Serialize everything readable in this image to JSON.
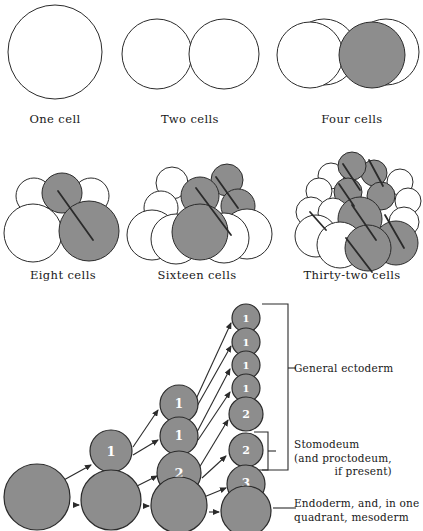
{
  "figure": {
    "colors": {
      "cell_fill_shaded": "#8d8d8d",
      "cell_fill_clear": "#ffffff",
      "outline": "#2b2b2b",
      "text": "#181818",
      "background": "#ffffff"
    },
    "cleavage_stages": [
      {
        "id": "one-cell",
        "label": "One cell",
        "label_x": 55,
        "label_y": 112,
        "cells": [
          {
            "cx": 55,
            "cy": 52,
            "r": 47,
            "shaded": false
          }
        ],
        "axis_lines": []
      },
      {
        "id": "two-cells",
        "label": "Two cells",
        "label_x": 190,
        "label_y": 112,
        "cells": [
          {
            "cx": 157,
            "cy": 54,
            "r": 35,
            "shaded": false
          },
          {
            "cx": 224,
            "cy": 54,
            "r": 35,
            "shaded": false
          }
        ],
        "axis_lines": []
      },
      {
        "id": "four-cells",
        "label": "Four cells",
        "label_x": 352,
        "label_y": 112,
        "cells": [
          {
            "cx": 324,
            "cy": 52,
            "r": 33,
            "shaded": false
          },
          {
            "cx": 386,
            "cy": 52,
            "r": 33,
            "shaded": false
          },
          {
            "cx": 310,
            "cy": 55,
            "r": 33,
            "shaded": false
          },
          {
            "cx": 372,
            "cy": 55,
            "r": 33,
            "shaded": true
          }
        ],
        "axis_lines": []
      },
      {
        "id": "eight-cells",
        "label": "Eight cells",
        "label_x": 63,
        "label_y": 268,
        "cells": [
          {
            "cx": 34,
            "cy": 196,
            "r": 18,
            "shaded": false
          },
          {
            "cx": 91,
            "cy": 196,
            "r": 18,
            "shaded": false
          },
          {
            "cx": 62,
            "cy": 193,
            "r": 20,
            "shaded": true
          },
          {
            "cx": 33,
            "cy": 233,
            "r": 29,
            "shaded": false
          },
          {
            "cx": 89,
            "cy": 231,
            "r": 30,
            "shaded": true
          }
        ],
        "axis_lines": [
          {
            "x1": 58,
            "y1": 191,
            "x2": 93,
            "y2": 240
          }
        ]
      },
      {
        "id": "sixteen-cells",
        "label": "Sixteen cells",
        "label_x": 197,
        "label_y": 268,
        "cells": [
          {
            "cx": 172,
            "cy": 183,
            "r": 16,
            "shaded": false
          },
          {
            "cx": 227,
            "cy": 180,
            "r": 16,
            "shaded": true
          },
          {
            "cx": 161,
            "cy": 208,
            "r": 17,
            "shaded": false
          },
          {
            "cx": 238,
            "cy": 206,
            "r": 17,
            "shaded": true
          },
          {
            "cx": 200,
            "cy": 196,
            "r": 19,
            "shaded": true
          },
          {
            "cx": 152,
            "cy": 235,
            "r": 25,
            "shaded": false
          },
          {
            "cx": 247,
            "cy": 234,
            "r": 25,
            "shaded": false
          },
          {
            "cx": 176,
            "cy": 239,
            "r": 25,
            "shaded": false
          },
          {
            "cx": 224,
            "cy": 238,
            "r": 25,
            "shaded": false
          },
          {
            "cx": 200,
            "cy": 232,
            "r": 28,
            "shaded": true
          }
        ],
        "axis_lines": [
          {
            "x1": 196,
            "y1": 188,
            "x2": 231,
            "y2": 235
          },
          {
            "x1": 216,
            "y1": 177,
            "x2": 238,
            "y2": 208
          }
        ]
      },
      {
        "id": "thirty-two-cells",
        "label": "Thirty-two cells",
        "label_x": 352,
        "label_y": 268,
        "cells": [
          {
            "cx": 331,
            "cy": 176,
            "r": 13,
            "shaded": false
          },
          {
            "cx": 374,
            "cy": 173,
            "r": 13,
            "shaded": true
          },
          {
            "cx": 400,
            "cy": 182,
            "r": 13,
            "shaded": false
          },
          {
            "cx": 319,
            "cy": 191,
            "r": 13,
            "shaded": false
          },
          {
            "cx": 352,
            "cy": 166,
            "r": 14,
            "shaded": true
          },
          {
            "cx": 348,
            "cy": 192,
            "r": 14,
            "shaded": true
          },
          {
            "cx": 381,
            "cy": 196,
            "r": 14,
            "shaded": true
          },
          {
            "cx": 408,
            "cy": 201,
            "r": 13,
            "shaded": false
          },
          {
            "cx": 311,
            "cy": 212,
            "r": 15,
            "shaded": false
          },
          {
            "cx": 333,
            "cy": 213,
            "r": 15,
            "shaded": false
          },
          {
            "cx": 404,
            "cy": 222,
            "r": 15,
            "shaded": false
          },
          {
            "cx": 316,
            "cy": 236,
            "r": 21,
            "shaded": false
          },
          {
            "cx": 360,
            "cy": 219,
            "r": 22,
            "shaded": true
          },
          {
            "cx": 396,
            "cy": 243,
            "r": 22,
            "shaded": true
          },
          {
            "cx": 340,
            "cy": 245,
            "r": 23,
            "shaded": false
          },
          {
            "cx": 368,
            "cy": 248,
            "r": 23,
            "shaded": true
          }
        ],
        "axis_lines": [
          {
            "x1": 343,
            "y1": 164,
            "x2": 360,
            "y2": 190
          },
          {
            "x1": 369,
            "y1": 160,
            "x2": 383,
            "y2": 186
          },
          {
            "x1": 339,
            "y1": 184,
            "x2": 354,
            "y2": 206
          },
          {
            "x1": 352,
            "y1": 205,
            "x2": 376,
            "y2": 240
          },
          {
            "x1": 310,
            "y1": 212,
            "x2": 326,
            "y2": 230
          },
          {
            "x1": 385,
            "y1": 215,
            "x2": 404,
            "y2": 248
          },
          {
            "x1": 346,
            "y1": 238,
            "x2": 372,
            "y2": 272
          }
        ]
      }
    ],
    "lineage": {
      "columns": [
        {
          "id": "col-1-one-cell",
          "cells": [
            {
              "cx": 37,
              "cy": 497,
              "r": 33,
              "label": "",
              "font": 0
            }
          ]
        },
        {
          "id": "col-2-two-cells",
          "cells": [
            {
              "cx": 111,
              "cy": 451,
              "r": 21,
              "label": "1",
              "font": 13
            },
            {
              "cx": 111,
              "cy": 500,
              "r": 30,
              "label": "",
              "font": 0
            }
          ]
        },
        {
          "id": "col-3-four-cells",
          "cells": [
            {
              "cx": 179,
              "cy": 404,
              "r": 19,
              "label": "1",
              "font": 12
            },
            {
              "cx": 179,
              "cy": 436,
              "r": 19,
              "label": "1",
              "font": 12
            },
            {
              "cx": 179,
              "cy": 473,
              "r": 22,
              "label": "2",
              "font": 13
            },
            {
              "cx": 179,
              "cy": 505,
              "r": 28,
              "label": "",
              "font": 0
            }
          ]
        },
        {
          "id": "col-4-eight-cells",
          "cells": [
            {
              "cx": 246,
              "cy": 318,
              "r": 14,
              "label": "1",
              "font": 10
            },
            {
              "cx": 246,
              "cy": 342,
              "r": 14,
              "label": "1",
              "font": 10
            },
            {
              "cx": 246,
              "cy": 365,
              "r": 14,
              "label": "1",
              "font": 10
            },
            {
              "cx": 246,
              "cy": 388,
              "r": 14,
              "label": "1",
              "font": 10
            },
            {
              "cx": 246,
              "cy": 414,
              "r": 17,
              "label": "2",
              "font": 11
            },
            {
              "cx": 246,
              "cy": 450,
              "r": 17,
              "label": "2",
              "font": 11
            },
            {
              "cx": 246,
              "cy": 484,
              "r": 19,
              "label": "3",
              "font": 12
            },
            {
              "cx": 246,
              "cy": 511,
              "r": 25,
              "label": "",
              "font": 0
            }
          ]
        }
      ],
      "arrows": [
        {
          "x1": 73,
          "y1": 505,
          "x2": 79,
          "y2": 505
        },
        {
          "x1": 62,
          "y1": 481,
          "x2": 91,
          "y2": 465
        },
        {
          "x1": 143,
          "y1": 506,
          "x2": 149,
          "y2": 506
        },
        {
          "x1": 135,
          "y1": 487,
          "x2": 157,
          "y2": 476
        },
        {
          "x1": 133,
          "y1": 455,
          "x2": 158,
          "y2": 440
        },
        {
          "x1": 133,
          "y1": 447,
          "x2": 158,
          "y2": 410
        },
        {
          "x1": 209,
          "y1": 512,
          "x2": 219,
          "y2": 512
        },
        {
          "x1": 204,
          "y1": 497,
          "x2": 226,
          "y2": 488
        },
        {
          "x1": 202,
          "y1": 478,
          "x2": 226,
          "y2": 456
        },
        {
          "x1": 199,
          "y1": 468,
          "x2": 228,
          "y2": 420
        },
        {
          "x1": 198,
          "y1": 440,
          "x2": 230,
          "y2": 392
        },
        {
          "x1": 197,
          "y1": 432,
          "x2": 230,
          "y2": 369
        },
        {
          "x1": 196,
          "y1": 408,
          "x2": 231,
          "y2": 346
        },
        {
          "x1": 196,
          "y1": 399,
          "x2": 231,
          "y2": 323
        }
      ],
      "brackets": [
        {
          "id": "bracket-general-ectoderm",
          "x_right": 288,
          "x_left": 262,
          "y_top": 304,
          "y_bottom": 470,
          "y_tick": 368
        },
        {
          "id": "bracket-stomodeum",
          "x_right": 268,
          "x_left": 254,
          "y_top": 432,
          "y_bottom": 470,
          "y_tick": 451
        },
        {
          "id": "bracket-endoderm",
          "x_right": 288,
          "x_left": 273,
          "y_top": 508,
          "y_bottom": 508,
          "y_tick": 508
        }
      ],
      "fate_labels": [
        {
          "id": "general-ectoderm",
          "x": 294,
          "y": 362,
          "lines": [
            "General ectoderm"
          ]
        },
        {
          "id": "stomodeum",
          "x": 294,
          "y": 438,
          "lines": [
            "Stomodeum",
            "(and proctodeum,",
            "if present)"
          ],
          "indent_last": true
        },
        {
          "id": "endoderm",
          "x": 294,
          "y": 497,
          "lines": [
            "Endoderm, and, in one",
            "quadrant, mesoderm"
          ]
        }
      ]
    }
  }
}
